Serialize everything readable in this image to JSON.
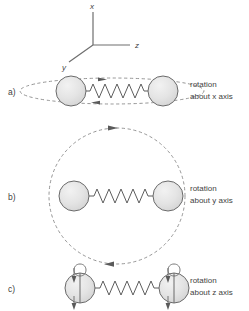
{
  "figure": {
    "title_present": false,
    "background_color": "#ffffff",
    "line_color": "#6a6a6a",
    "sphere_fill_color": "#e2e2e2",
    "sphere_stroke_color": "#6a6a6a",
    "dashed_stroke_color": "#8a8a8a",
    "text_color": "#3f3f3f"
  },
  "axes": {
    "name": "coordinate-axes",
    "origin_label": "",
    "x_label": "x",
    "y_label": "y",
    "z_label": "z"
  },
  "panels": [
    {
      "id": "a",
      "label": "a)",
      "caption_line1": "rotation",
      "caption_line2": "about x axis",
      "orbit_type": "flat-ellipse",
      "orbit_rx": 92,
      "orbit_ry": 13,
      "arrow_top_direction": "right",
      "arrow_bottom_direction": "left",
      "spheres": 2,
      "spring_coils": 8
    },
    {
      "id": "b",
      "label": "b)",
      "caption_line1": "rotation",
      "caption_line2": "about y axis",
      "orbit_type": "circle",
      "orbit_rx": 68,
      "orbit_ry": 68,
      "arrow_top_direction": "right",
      "arrow_bottom_direction": "left",
      "spheres": 2,
      "spring_coils": 8
    },
    {
      "id": "c",
      "label": "c)",
      "caption_line1": "rotation",
      "caption_line2": "about z axis",
      "orbit_type": "vertical-loop-per-sphere",
      "orbit_rx": 8,
      "orbit_ry": 26,
      "arrow_top_direction": "down",
      "arrow_bottom_direction": "down",
      "spheres": 2,
      "spring_coils": 8
    }
  ]
}
